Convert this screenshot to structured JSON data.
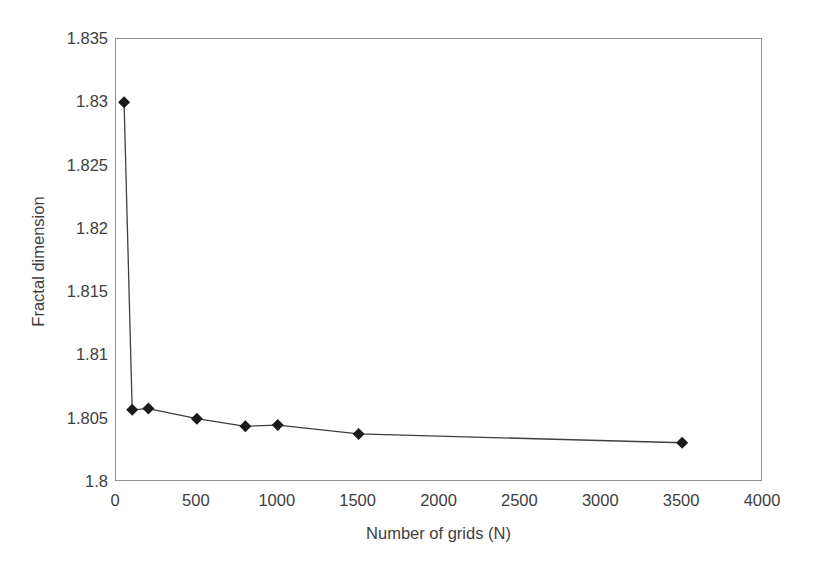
{
  "chart_data": {
    "type": "line",
    "title": "",
    "subtitle": "",
    "xlabel": "Number of grids (N)",
    "ylabel": "Fractal dimension",
    "xlim": [
      0,
      4000
    ],
    "ylim": [
      1.8,
      1.835
    ],
    "x_ticks": [
      0,
      500,
      1000,
      1500,
      2000,
      2500,
      3000,
      3500,
      4000
    ],
    "x_tick_labels": [
      "0",
      "500",
      "1000",
      "1500",
      "2000",
      "2500",
      "3000",
      "3500",
      "4000"
    ],
    "y_ticks": [
      1.8,
      1.805,
      1.81,
      1.815,
      1.82,
      1.825,
      1.83,
      1.835
    ],
    "y_tick_labels": [
      "1.8",
      "1.805",
      "1.81",
      "1.815",
      "1.82",
      "1.825",
      "1.83",
      "1.835"
    ],
    "grid": false,
    "legend": null,
    "legend_position": "none",
    "marker": "diamond",
    "marker_color": "#1a1a1a",
    "line_color": "#3f3f3f",
    "series": [
      {
        "name": "Fractal dimension vs number of grids",
        "x": [
          50,
          100,
          200,
          500,
          800,
          1000,
          1500,
          3500
        ],
        "y": [
          1.83,
          1.8057,
          1.8058,
          1.805,
          1.8044,
          1.8045,
          1.8038,
          1.8031
        ]
      }
    ],
    "annotations": []
  },
  "axes": {
    "x_title": "Number of grids (N)",
    "y_title": "Fractal dimension"
  },
  "colors": {
    "frame": "#8e8e8e",
    "text": "#404040",
    "marker": "#1a1a1a",
    "line": "#3f3f3f",
    "background": "#ffffff"
  }
}
